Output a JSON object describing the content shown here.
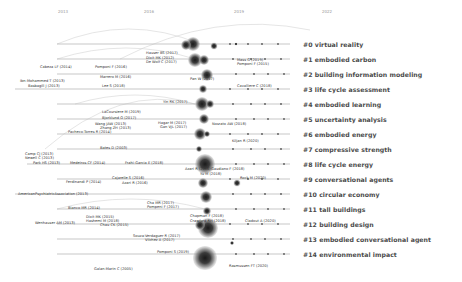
{
  "timeline": {
    "years": [
      {
        "label": "2013",
        "x": 63
      },
      {
        "label": "2016",
        "x": 149
      },
      {
        "label": "2019",
        "x": 239
      },
      {
        "label": "2022",
        "x": 327
      }
    ]
  },
  "clusters": [
    {
      "id": "#0",
      "label": "#0 virtual reality",
      "y": 44,
      "x_start": 57,
      "x_end": 290
    },
    {
      "id": "#1",
      "label": "#1 embodied carbon",
      "y": 59,
      "x_start": 57,
      "x_end": 290
    },
    {
      "id": "#2",
      "label": "#2 building information modeling",
      "y": 74,
      "x_start": 57,
      "x_end": 290
    },
    {
      "id": "#3",
      "label": "#3 life cycle assessment",
      "y": 89,
      "x_start": 15,
      "x_end": 290
    },
    {
      "id": "#4",
      "label": "#4 embodied learning",
      "y": 104,
      "x_start": 57,
      "x_end": 290
    },
    {
      "id": "#5",
      "label": "#5 uncertainty analysis",
      "y": 119,
      "x_start": 57,
      "x_end": 290
    },
    {
      "id": "#6",
      "label": "#6 embodied energy",
      "y": 134,
      "x_start": 57,
      "x_end": 290
    },
    {
      "id": "#7",
      "label": "#7 compressive strength",
      "y": 149,
      "x_start": 57,
      "x_end": 290
    },
    {
      "id": "#8",
      "label": "#8 life cycle energy",
      "y": 164,
      "x_start": 27,
      "x_end": 290
    },
    {
      "id": "#9",
      "label": "#9 conversational agents",
      "y": 179,
      "x_start": 57,
      "x_end": 290
    },
    {
      "id": "#10",
      "label": "#10 circular economy",
      "y": 194,
      "x_start": 15,
      "x_end": 290
    },
    {
      "id": "#11",
      "label": "#11 tall buildings",
      "y": 209,
      "x_start": 57,
      "x_end": 290
    },
    {
      "id": "#12",
      "label": "#12 building design",
      "y": 224,
      "x_start": 57,
      "x_end": 290
    },
    {
      "id": "#13",
      "label": "#13 embodied conversational agent",
      "y": 239,
      "x_start": 57,
      "x_end": 290
    },
    {
      "id": "#14",
      "label": "#14 environmental impact",
      "y": 254,
      "x_start": 57,
      "x_end": 290
    }
  ],
  "nodes": [
    {
      "label": "Hauser BS (2017)",
      "x": 146,
      "y": 53
    },
    {
      "label": "Dixit MK (2012)",
      "x": 146,
      "y": 58
    },
    {
      "label": "De Wolf C (2017)",
      "x": 146,
      "y": 62
    },
    {
      "label": "Cabeza LF (2014)",
      "x": 40,
      "y": 67
    },
    {
      "label": "Pomponi F (2016)",
      "x": 95,
      "y": 67
    },
    {
      "label": "Mass G (2019)",
      "x": 237,
      "y": 60
    },
    {
      "label": "Pomponi F (2015)",
      "x": 237,
      "y": 64
    },
    {
      "label": "Marrero M (2016)",
      "x": 100,
      "y": 77
    },
    {
      "label": "Pan W (2017)",
      "x": 190,
      "y": 79
    },
    {
      "label": "Ibn-Mohammed T (2013)",
      "x": 20,
      "y": 81
    },
    {
      "label": "Basbagill J (2013)",
      "x": 28,
      "y": 86
    },
    {
      "label": "Lee S (2018)",
      "x": 102,
      "y": 86
    },
    {
      "label": "Cavalliere C (2018)",
      "x": 237,
      "y": 86
    },
    {
      "label": "Yin RK (2017)",
      "x": 163,
      "y": 102
    },
    {
      "label": "LaCoursiere M (2019)",
      "x": 102,
      "y": 112
    },
    {
      "label": "Bjorklund O (2017)",
      "x": 102,
      "y": 118
    },
    {
      "label": "Wang JAW (2013)",
      "x": 95,
      "y": 124
    },
    {
      "label": "Hagar M (2017)",
      "x": 158,
      "y": 123
    },
    {
      "label": "Zhang ZH (2013)",
      "x": 100,
      "y": 128
    },
    {
      "label": "Gan VJL (2017)",
      "x": 160,
      "y": 127
    },
    {
      "label": "Pacheco-Torres R (2014)",
      "x": 68,
      "y": 132
    },
    {
      "label": "Nosrato AW (2018)",
      "x": 212,
      "y": 124
    },
    {
      "label": "Bates D (2003)",
      "x": 100,
      "y": 148
    },
    {
      "label": "Kiljan R (2020)",
      "x": 232,
      "y": 141
    },
    {
      "label": "Camp CJ (2013)",
      "x": 25,
      "y": 154
    },
    {
      "label": "Newell C (2013)",
      "x": 25,
      "y": 158
    },
    {
      "label": "Park HS (2013)",
      "x": 33,
      "y": 163
    },
    {
      "label": "Medeiros CF (2014)",
      "x": 70,
      "y": 163
    },
    {
      "label": "Frahi-Garcia E (2018)",
      "x": 125,
      "y": 163
    },
    {
      "label": "Azari R (2016)",
      "x": 185,
      "y": 169
    },
    {
      "label": "Gaudiano F (2018)",
      "x": 211,
      "y": 169
    },
    {
      "label": "Yu M (2018)",
      "x": 200,
      "y": 174
    },
    {
      "label": "Cajarelle S (2016)",
      "x": 112,
      "y": 178
    },
    {
      "label": "Azari R (2016)",
      "x": 122,
      "y": 183
    },
    {
      "label": "Ferdinandi P (2014)",
      "x": 66,
      "y": 182
    },
    {
      "label": "Rock M (2020)",
      "x": 240,
      "y": 178
    },
    {
      "label": "AmericanPsychiatricAssociation (2013)",
      "x": 18,
      "y": 194
    },
    {
      "label": "Cha MR (2017)",
      "x": 147,
      "y": 203
    },
    {
      "label": "Pompeni F (2017)",
      "x": 147,
      "y": 207
    },
    {
      "label": "Bianco MR (2014)",
      "x": 68,
      "y": 208
    },
    {
      "label": "Dixit MK (2015)",
      "x": 86,
      "y": 217
    },
    {
      "label": "Chapman F (2018)",
      "x": 190,
      "y": 216
    },
    {
      "label": "Hashemi M (2018)",
      "x": 86,
      "y": 221
    },
    {
      "label": "Crawford RH (2018)",
      "x": 190,
      "y": 221
    },
    {
      "label": "Wenhauser AM (2013)",
      "x": 35,
      "y": 223
    },
    {
      "label": "Chau CK (2015)",
      "x": 100,
      "y": 225
    },
    {
      "label": "Cladout A (2020)",
      "x": 245,
      "y": 221
    },
    {
      "label": "Souza-Verdaguer R (2017)",
      "x": 133,
      "y": 236
    },
    {
      "label": "Vilchez A (2017)",
      "x": 145,
      "y": 240
    },
    {
      "label": "Pomponi S (2019)",
      "x": 157,
      "y": 252
    },
    {
      "label": "Galan-Marin C (2005)",
      "x": 94,
      "y": 269
    },
    {
      "label": "Rasmussen FT (2020)",
      "x": 229,
      "y": 266
    }
  ],
  "bubbles": [
    {
      "x": 193,
      "y": 44,
      "r": 7
    },
    {
      "x": 186,
      "y": 45,
      "r": 5
    },
    {
      "x": 214,
      "y": 46,
      "r": 3.5
    },
    {
      "x": 236,
      "y": 44,
      "r": 1.5
    },
    {
      "x": 195,
      "y": 60,
      "r": 7
    },
    {
      "x": 204,
      "y": 60,
      "r": 5
    },
    {
      "x": 207,
      "y": 75,
      "r": 6
    },
    {
      "x": 203,
      "y": 89,
      "r": 4
    },
    {
      "x": 202,
      "y": 104,
      "r": 7
    },
    {
      "x": 210,
      "y": 104,
      "r": 4
    },
    {
      "x": 204,
      "y": 119,
      "r": 5
    },
    {
      "x": 200,
      "y": 134,
      "r": 6
    },
    {
      "x": 207,
      "y": 134,
      "r": 3
    },
    {
      "x": 199,
      "y": 149,
      "r": 3
    },
    {
      "x": 205,
      "y": 164,
      "r": 10
    },
    {
      "x": 203,
      "y": 183,
      "r": 5
    },
    {
      "x": 237,
      "y": 183,
      "r": 3.5
    },
    {
      "x": 206,
      "y": 197,
      "r": 6
    },
    {
      "x": 207,
      "y": 211,
      "r": 4
    },
    {
      "x": 208,
      "y": 228,
      "r": 10
    },
    {
      "x": 200,
      "y": 225,
      "r": 5
    },
    {
      "x": 232,
      "y": 243,
      "r": 2
    },
    {
      "x": 205,
      "y": 258,
      "r": 12
    }
  ],
  "arcs": [
    {
      "x1": 57,
      "y1": 44,
      "x2": 200,
      "y2": 44,
      "h": 30
    },
    {
      "x1": 57,
      "y1": 59,
      "x2": 195,
      "y2": 59,
      "h": 22
    },
    {
      "x1": 120,
      "y1": 59,
      "x2": 310,
      "y2": 30,
      "h": 20
    },
    {
      "x1": 75,
      "y1": 104,
      "x2": 195,
      "y2": 104,
      "h": 18
    },
    {
      "x1": 45,
      "y1": 149,
      "x2": 195,
      "y2": 104,
      "h": 20
    },
    {
      "x1": 57,
      "y1": 209,
      "x2": 205,
      "y2": 209,
      "h": 20
    }
  ],
  "colors": {
    "lane": "#b9b9b9",
    "label": "#4a4a4a",
    "node_core": "#222222",
    "node_ring": "#6a6a6a"
  }
}
